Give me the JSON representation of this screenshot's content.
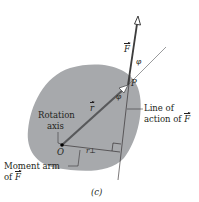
{
  "figure": {
    "caption": "(c)",
    "colors": {
      "body_fill": "#a7a9ac",
      "line": "#231f20",
      "force_arrow": "#3d3d3d",
      "r_vector": "#58595b",
      "thin_line": "#6d6e71",
      "background": "#ffffff"
    },
    "labels": {
      "force": "F",
      "phi_top": "φ",
      "point_p": "P",
      "phi_bottom": "φ",
      "r_vector": "r",
      "rotation_axis_line1": "Rotation",
      "rotation_axis_line2": "axis",
      "origin": "O",
      "r_perp": "r⊥",
      "line_of_action_line1": "Line of",
      "line_of_action_line2_prefix": "action of ",
      "line_of_action_force": "F",
      "moment_arm_line1": "Moment arm",
      "moment_arm_line2_prefix": "of ",
      "moment_arm_force": "F"
    }
  }
}
